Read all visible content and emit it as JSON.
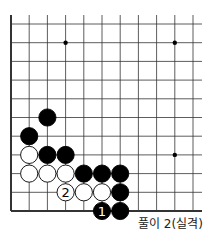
{
  "caption": "풀이 2(실격)",
  "board": {
    "origin_x": 11,
    "origin_y": 24,
    "step_x": 18.2,
    "step_y": 18.7,
    "cols": 11,
    "rows": 11,
    "line_right": 202,
    "line_top": 15,
    "stone_radius": 8.6,
    "colors": {
      "black": "#000000",
      "white": "#ffffff",
      "line": "#333333"
    },
    "hoshi": [
      [
        3,
        1
      ],
      [
        9,
        1
      ],
      [
        9,
        7
      ]
    ],
    "stones": [
      {
        "col": 2,
        "row": 5,
        "color": "black"
      },
      {
        "col": 1,
        "row": 6,
        "color": "black"
      },
      {
        "col": 1,
        "row": 7,
        "color": "white"
      },
      {
        "col": 2,
        "row": 7,
        "color": "black"
      },
      {
        "col": 3,
        "row": 7,
        "color": "black"
      },
      {
        "col": 1,
        "row": 8,
        "color": "white"
      },
      {
        "col": 2,
        "row": 8,
        "color": "white"
      },
      {
        "col": 3,
        "row": 8,
        "color": "white"
      },
      {
        "col": 4,
        "row": 8,
        "color": "black"
      },
      {
        "col": 5,
        "row": 8,
        "color": "black"
      },
      {
        "col": 6,
        "row": 8,
        "color": "black"
      },
      {
        "col": 3,
        "row": 9,
        "color": "white",
        "label": "2"
      },
      {
        "col": 4,
        "row": 9,
        "color": "white"
      },
      {
        "col": 5,
        "row": 9,
        "color": "white"
      },
      {
        "col": 6,
        "row": 9,
        "color": "black"
      },
      {
        "col": 5,
        "row": 10,
        "color": "black",
        "label": "1"
      },
      {
        "col": 6,
        "row": 10,
        "color": "black"
      }
    ]
  }
}
